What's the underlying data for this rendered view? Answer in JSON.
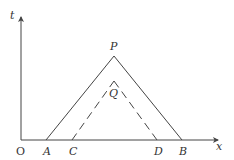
{
  "diagram": {
    "type": "space-time diagram",
    "axes": {
      "vertical_label": "t",
      "horizontal_label": "x",
      "origin_label": "O"
    },
    "points": {
      "P": "P",
      "Q": "Q",
      "A": "A",
      "B": "B",
      "C": "C",
      "D": "D"
    },
    "lines": [
      {
        "from": "A",
        "to": "P",
        "style": "solid"
      },
      {
        "from": "P",
        "to": "B",
        "style": "solid"
      },
      {
        "from": "C",
        "to": "Q",
        "style": "dashed"
      },
      {
        "from": "Q",
        "to": "D",
        "style": "dashed"
      }
    ],
    "stroke_color": "#444444"
  }
}
